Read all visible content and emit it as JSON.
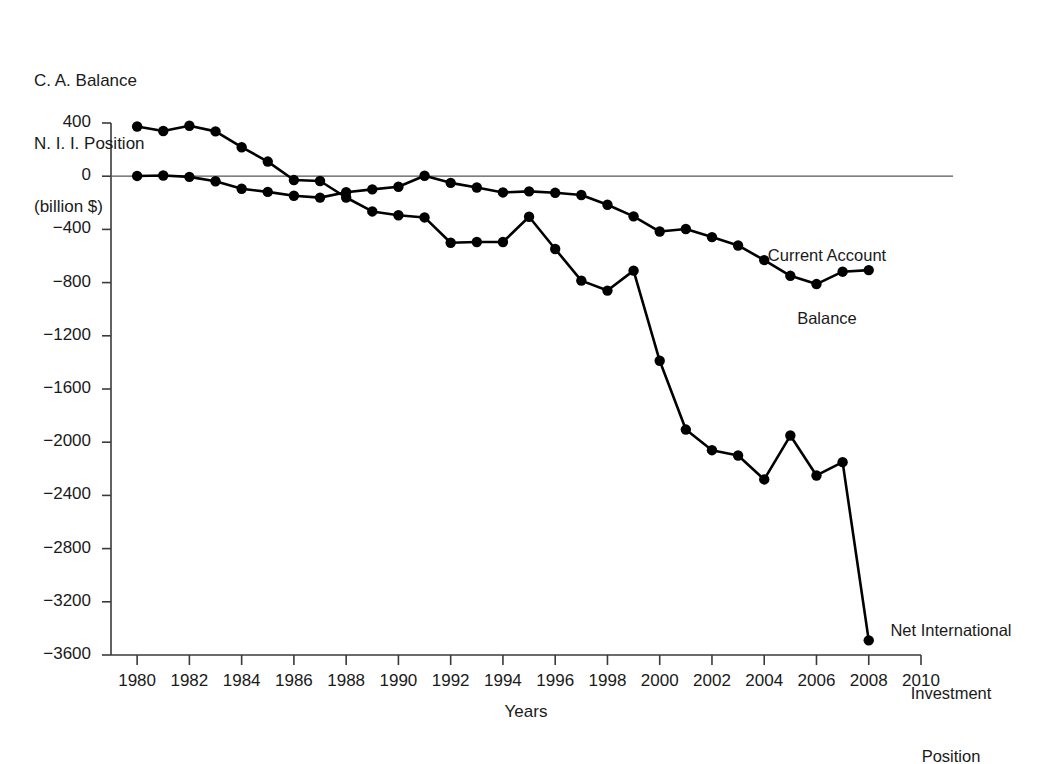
{
  "figure": {
    "y_axis_caption_lines": [
      "C. A. Balance",
      "N. I. I. Position",
      "(billion $)"
    ],
    "x_axis_title": "Years",
    "series_labels": {
      "current_account": [
        "Current Account",
        "Balance"
      ],
      "niip": [
        "Net International",
        "Investment",
        "Position"
      ]
    },
    "line_color": "#000000",
    "marker_color": "#000000",
    "zero_line_color": "#555555"
  },
  "chart_data": {
    "type": "line",
    "title": "",
    "subtitle": "",
    "xlabel": "Years",
    "ylabel": "C. A. Balance N. I. I. Position (billion $)",
    "xlim": [
      1979,
      2010
    ],
    "ylim": [
      -3600,
      400
    ],
    "xticks": [
      1980,
      1982,
      1984,
      1986,
      1988,
      1990,
      1992,
      1994,
      1996,
      1998,
      2000,
      2002,
      2004,
      2006,
      2008,
      2010
    ],
    "xtick_labels": [
      "1980",
      "1982",
      "1984",
      "1986",
      "1988",
      "1990",
      "1992",
      "1994",
      "1996",
      "1998",
      "2000",
      "2002",
      "2004",
      "2006",
      "2008",
      "2010"
    ],
    "yticks": [
      400,
      0,
      -400,
      -800,
      -1200,
      -1600,
      -2000,
      -2400,
      -2800,
      -3200,
      -3600
    ],
    "ytick_labels": [
      "400",
      "0",
      "−400",
      "−800",
      "−1200",
      "−1600",
      "−2000",
      "−2400",
      "−2800",
      "−3200",
      "−3600"
    ],
    "grid": false,
    "legend_position": "inline-annotation",
    "zero_reference_line": 0,
    "x": [
      1980,
      1981,
      1982,
      1983,
      1984,
      1985,
      1986,
      1987,
      1988,
      1989,
      1990,
      1991,
      1992,
      1993,
      1994,
      1995,
      1996,
      1997,
      1998,
      1999,
      2000,
      2001,
      2002,
      2003,
      2004,
      2005,
      2006,
      2007,
      2008
    ],
    "series": [
      {
        "name": "Current Account Balance",
        "marker": "filled-circle",
        "values": [
          2,
          5,
          -5,
          -38,
          -94,
          -118,
          -147,
          -161,
          -121,
          -99,
          -79,
          3,
          -50,
          -85,
          -122,
          -114,
          -125,
          -141,
          -215,
          -302,
          -416,
          -397,
          -458,
          -521,
          -631,
          -749,
          -811,
          -718,
          -706
        ]
      },
      {
        "name": "Net International Investment Position",
        "marker": "filled-circle",
        "values": [
          374,
          340,
          379,
          337,
          218,
          110,
          -29,
          -36,
          -160,
          -265,
          -294,
          -310,
          -500,
          -495,
          -495,
          -305,
          -547,
          -785,
          -860,
          -710,
          -1388,
          -1905,
          -2060,
          -2100,
          -2280,
          -1950,
          -2250,
          -2150,
          -3490
        ]
      }
    ]
  }
}
